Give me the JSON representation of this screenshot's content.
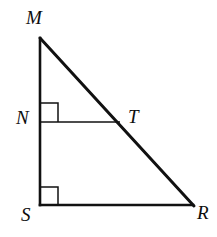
{
  "figure": {
    "background_color": "#ffffff",
    "stroke_color": "#111111",
    "label_color": "#0d0d0d",
    "width": 217,
    "height": 237,
    "labels": {
      "apex": "M",
      "left_mid": "N",
      "hypotenuse_point": "T",
      "bottom_left": "S",
      "bottom_right": "R"
    },
    "points": {
      "M": {
        "x": 40,
        "y": 38
      },
      "N": {
        "x": 40,
        "y": 122
      },
      "T": {
        "x": 118,
        "y": 122
      },
      "S": {
        "x": 40,
        "y": 205
      },
      "R": {
        "x": 193,
        "y": 205
      }
    },
    "segments": [
      {
        "name": "MS",
        "from": "M",
        "to": "S",
        "thickness": 2.6,
        "note": "left leg, vertical"
      },
      {
        "name": "SR",
        "from": "S",
        "to": "R",
        "thickness": 2.6,
        "note": "bottom leg, horizontal"
      },
      {
        "name": "MR",
        "from": "M",
        "to": "R",
        "thickness": 3.0,
        "note": "hypotenuse"
      },
      {
        "name": "NT",
        "from": "N",
        "to": "T",
        "thickness": 1.5,
        "note": "midsegment, parallel to SR"
      }
    ],
    "right_angle_marks": [
      {
        "name": "right-angle-at-N",
        "x": 40,
        "y": 103,
        "size": 18,
        "thickness": 1.4
      },
      {
        "name": "right-angle-at-S",
        "x": 40,
        "y": 187,
        "size": 18,
        "thickness": 1.4
      }
    ]
  }
}
